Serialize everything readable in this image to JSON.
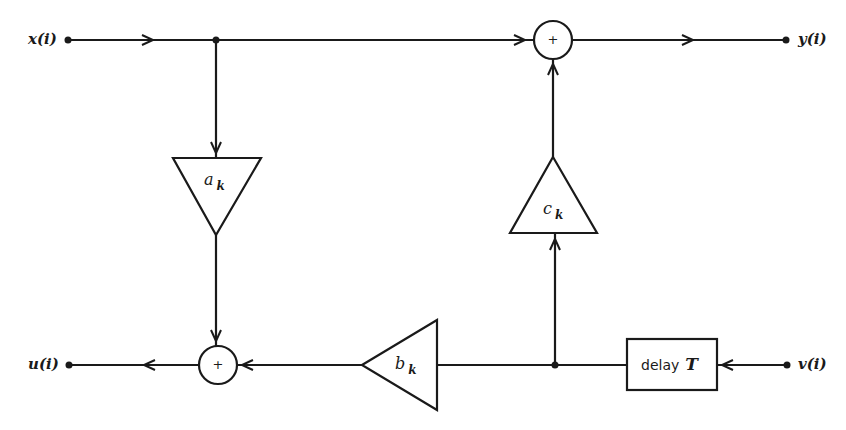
{
  "diagram": {
    "type": "signal-flow block diagram",
    "colors": {
      "stroke": "#1a1a1a",
      "background": "#ffffff"
    },
    "nodes": {
      "input_x": {
        "label": "x(i)"
      },
      "output_y": {
        "label": "y(i)"
      },
      "output_u": {
        "label": "u(i)"
      },
      "input_v": {
        "label": "v(i)"
      },
      "adder_top": {
        "symbol": "+"
      },
      "adder_bottom": {
        "symbol": "+"
      },
      "gain_a": {
        "base": "a",
        "sub": "k"
      },
      "gain_b": {
        "base": "b",
        "sub": "k"
      },
      "gain_c": {
        "base": "c",
        "sub": "k"
      },
      "delay": {
        "text": "delay",
        "param": "T"
      }
    },
    "edges": [
      {
        "from": "x(i)",
        "to": "adder_top"
      },
      {
        "from": "x(i)",
        "to": "gain_a"
      },
      {
        "from": "adder_top",
        "to": "y(i)"
      },
      {
        "from": "gain_a",
        "to": "adder_bottom"
      },
      {
        "from": "v(i)",
        "to": "delay"
      },
      {
        "from": "delay",
        "to": "gain_b"
      },
      {
        "from": "delay",
        "to": "gain_c"
      },
      {
        "from": "gain_c",
        "to": "adder_top"
      },
      {
        "from": "gain_b",
        "to": "adder_bottom"
      },
      {
        "from": "adder_bottom",
        "to": "u(i)"
      }
    ]
  }
}
